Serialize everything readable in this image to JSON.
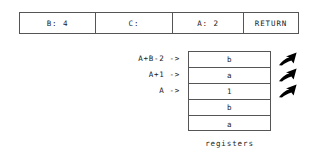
{
  "frame_table": {
    "cells": [
      {
        "label": "B: 4"
      },
      {
        "label": "C:"
      },
      {
        "label": "A: 2"
      },
      {
        "label": "RETURN"
      }
    ]
  },
  "register_labels": [
    {
      "text": "A+B-2 ->"
    },
    {
      "text": "A+1 ->"
    },
    {
      "text": "A ->"
    }
  ],
  "register_box": {
    "rows": [
      {
        "value": "b"
      },
      {
        "value": "a"
      },
      {
        "value": "1"
      },
      {
        "value": "b"
      },
      {
        "value": "a"
      }
    ],
    "caption": "registers"
  },
  "arrows": [
    {
      "icon": "arrow-up-right-icon"
    },
    {
      "icon": "arrow-up-right-icon"
    },
    {
      "icon": "arrow-up-right-icon"
    }
  ],
  "colors": {
    "background": "#ffffff",
    "border": "#555555",
    "text": "#1a1a1a",
    "arrow": "#000000"
  }
}
